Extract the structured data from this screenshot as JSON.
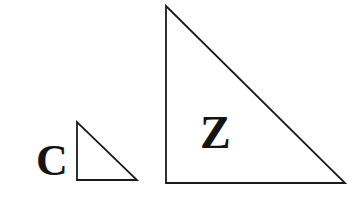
{
  "figure": {
    "name": "two-similar-right-triangles",
    "background_color": "#ffffff",
    "stroke_color": "#1a1a1a",
    "label_color": "#141414",
    "width": 363,
    "height": 201
  },
  "shapes": [
    {
      "id": "small-triangle",
      "name": "triangle-c",
      "label": "C",
      "label_position": "outside-left",
      "stroke_width": 1.8,
      "orientation": "right-angle-bottom-left",
      "vertices": [
        {
          "x": 77,
          "y": 122
        },
        {
          "x": 77,
          "y": 180
        },
        {
          "x": 137,
          "y": 180
        }
      ],
      "legs": {
        "vertical": 58,
        "horizontal": 60
      },
      "label_anchor": {
        "x": 36,
        "y": 175
      },
      "label_font_size": 44
    },
    {
      "id": "large-triangle",
      "name": "triangle-z",
      "label": "Z",
      "label_position": "inside",
      "stroke_width": 1.8,
      "orientation": "right-angle-bottom-left",
      "vertices": [
        {
          "x": 166,
          "y": 6
        },
        {
          "x": 166,
          "y": 183
        },
        {
          "x": 345,
          "y": 183
        }
      ],
      "legs": {
        "vertical": 177,
        "horizontal": 179
      },
      "label_anchor": {
        "x": 200,
        "y": 148
      },
      "label_font_size": 46
    }
  ],
  "chart_data": {
    "type": "diagram",
    "title": "",
    "labels": [
      "C",
      "Z"
    ]
  }
}
